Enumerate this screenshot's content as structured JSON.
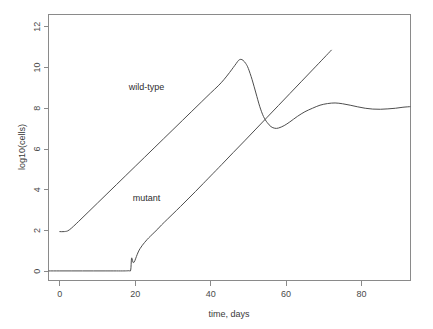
{
  "chart_data": {
    "type": "line",
    "title": "",
    "xlabel": "time, days",
    "ylabel": "log10(cells)",
    "xlim": [
      -3,
      93
    ],
    "ylim": [
      -0.45,
      12.6
    ],
    "xticks": [
      0,
      20,
      40,
      60,
      80
    ],
    "yticks": [
      0,
      2,
      4,
      6,
      8,
      10,
      12
    ],
    "xtick_labels": [
      "0",
      "20",
      "40",
      "60",
      "80"
    ],
    "ytick_labels": [
      "0",
      "2",
      "4",
      "6",
      "8",
      "10",
      "12"
    ],
    "grid": false,
    "legend": "inline-annotations",
    "frame": "box",
    "line_color": "#4d4d4d",
    "axis_color": "#8a8a8a",
    "background": "#ffffff",
    "annotations": [
      {
        "text": "wild-type",
        "x": 23,
        "y": 8.9
      },
      {
        "text": "mutant",
        "x": 23,
        "y": 3.45
      }
    ],
    "series": [
      {
        "name": "wild-type",
        "label": "wild-type",
        "x": [
          0,
          1.2,
          2.5,
          5,
          7.5,
          10,
          12.5,
          15,
          17.5,
          20,
          22.5,
          25,
          27.5,
          30,
          32.5,
          35,
          37.5,
          40,
          42,
          43.5,
          45,
          46,
          46.8,
          47.4,
          48,
          48.6,
          49.3,
          50,
          51,
          52,
          53,
          54,
          55,
          56,
          57,
          58,
          59.5,
          61,
          63,
          65,
          67,
          69,
          71,
          73,
          75,
          77,
          79,
          81,
          83,
          85,
          87,
          89,
          91,
          93
        ],
        "y": [
          1.95,
          1.95,
          2.03,
          2.45,
          2.9,
          3.35,
          3.8,
          4.25,
          4.7,
          5.15,
          5.6,
          6.05,
          6.5,
          6.95,
          7.4,
          7.85,
          8.3,
          8.75,
          9.1,
          9.4,
          9.75,
          10.0,
          10.2,
          10.35,
          10.4,
          10.35,
          10.2,
          9.95,
          9.4,
          8.75,
          8.1,
          7.6,
          7.3,
          7.1,
          7.02,
          7.03,
          7.15,
          7.33,
          7.6,
          7.83,
          8.0,
          8.15,
          8.23,
          8.26,
          8.22,
          8.15,
          8.07,
          8.0,
          7.96,
          7.95,
          7.97,
          8.0,
          8.05,
          8.08
        ]
      },
      {
        "name": "mutant",
        "label": "mutant",
        "x": [
          -3,
          0,
          3,
          6,
          9,
          12,
          15,
          17,
          18.3,
          18.8,
          19.0,
          19.2,
          19.4,
          19.6,
          19.9,
          20.3,
          20.8,
          21.3,
          21.9,
          22.5,
          23.2,
          24,
          25,
          26,
          27,
          28.5,
          30,
          32,
          34,
          36,
          38,
          40,
          43,
          46,
          49,
          52,
          55,
          58,
          61,
          64,
          67,
          70,
          72
        ],
        "y": [
          0.02,
          0.02,
          0.02,
          0.02,
          0.02,
          0.02,
          0.02,
          0.02,
          0.03,
          0.06,
          0.62,
          0.6,
          0.45,
          0.43,
          0.52,
          0.72,
          0.95,
          1.12,
          1.28,
          1.42,
          1.57,
          1.72,
          1.9,
          2.08,
          2.28,
          2.55,
          2.82,
          3.18,
          3.55,
          3.92,
          4.3,
          4.68,
          5.25,
          5.83,
          6.4,
          6.98,
          7.56,
          8.14,
          8.72,
          9.3,
          9.88,
          10.46,
          10.85
        ]
      }
    ]
  },
  "axis": {
    "x_title": "time, days",
    "y_title": "log10(cells)"
  }
}
